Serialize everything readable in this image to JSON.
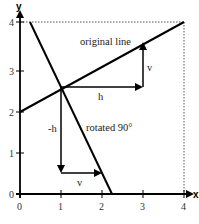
{
  "diagram": {
    "title": "",
    "axes": {
      "x_label": "x",
      "y_label": "y",
      "x_ticks": [
        "0",
        "1",
        "2",
        "3",
        "4"
      ],
      "y_ticks": [
        "0",
        "1",
        "2",
        "3",
        "4"
      ]
    },
    "labels": {
      "original_line": "original line",
      "rotated_line": "rotated 90°",
      "h_upper": "h",
      "v_upper": "v",
      "neg_h": "-h",
      "v_lower": "v"
    },
    "geometry": {
      "original_line": {
        "from": [
          0,
          2
        ],
        "to": [
          4,
          4
        ]
      },
      "rotated_line": {
        "from": [
          0.5,
          4
        ],
        "to": [
          2.25,
          0
        ]
      },
      "intersection": [
        1,
        2.5
      ],
      "arrow_h": {
        "from": [
          1,
          2.5
        ],
        "to": [
          3,
          2.5
        ]
      },
      "arrow_v": {
        "from": [
          3,
          2.5
        ],
        "to": [
          3,
          3.5
        ]
      },
      "arrow_neg_h": {
        "from": [
          1,
          2.5
        ],
        "to": [
          1,
          0.5
        ]
      },
      "arrow_v_lower": {
        "from": [
          1,
          0.5
        ],
        "to": [
          2,
          0.5
        ]
      },
      "dotted_box": {
        "x_max": 4,
        "y_max": 4
      }
    },
    "colors": {
      "line": "#000000",
      "dotted": "#555555",
      "text": "#222222"
    }
  }
}
